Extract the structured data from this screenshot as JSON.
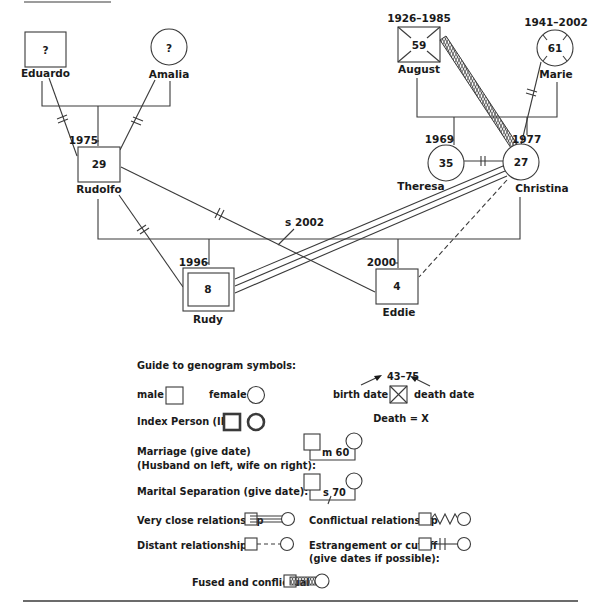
{
  "people": {
    "eduardo": {
      "name": "Eduardo",
      "age": "?"
    },
    "amalia": {
      "name": "Amalia",
      "age": "?"
    },
    "rudolfo": {
      "name": "Rudolfo",
      "age": "29",
      "birth": "1975"
    },
    "august": {
      "name": "August",
      "age": "59",
      "dates": "1926–1985"
    },
    "marie": {
      "name": "Marie",
      "age": "61",
      "dates": "1941–2002"
    },
    "theresa": {
      "name": "Theresa",
      "age": "35",
      "birth": "1969"
    },
    "christina": {
      "name": "Christina",
      "age": "27",
      "birth": "1977"
    },
    "rudy": {
      "name": "Rudy",
      "age": "8",
      "birth": "1996"
    },
    "eddie": {
      "name": "Eddie",
      "age": "4",
      "birth": "2000"
    }
  },
  "relationships": {
    "separation_label": "s 2002"
  },
  "legend": {
    "title": "Guide to genogram symbols:",
    "male": "male",
    "female": "female",
    "index_person": "Index Person (IP):",
    "birth_date": "birth date",
    "death_date": "death date",
    "dates_example": "43–75",
    "death_note": "Death = X",
    "marriage_line1": "Marriage (give date)",
    "marriage_line2": "(Husband on left, wife on right):",
    "marriage_example": "m 60",
    "separation": "Marital Separation (give date):",
    "separation_example": "s 70",
    "very_close": "Very close relationship",
    "conflictual": "Conflictual relationship",
    "distant": "Distant relationship",
    "estrangement_line1": "Estrangement or cutoff",
    "estrangement_line2": "(give dates if possible):",
    "fused": "Fused and conflictual"
  }
}
